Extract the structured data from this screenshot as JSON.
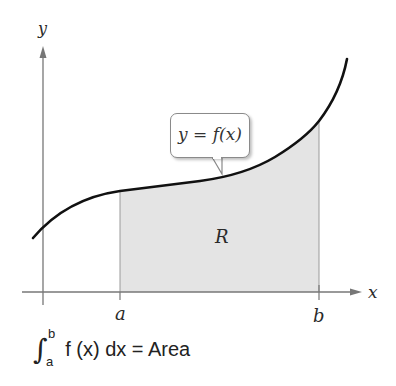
{
  "figure": {
    "axis_x_label": "x",
    "axis_y_label": "y",
    "a_label": "a",
    "b_label": "b",
    "region_label": "R",
    "callout_text": "y = f(x)",
    "equation": {
      "integral_symbol": "∫",
      "upper": "b",
      "lower": "a",
      "body": "f (x) dx = Area"
    },
    "colors": {
      "curve": "#111111",
      "axis": "#777777",
      "shade": "#e4e4e4",
      "shade_edge": "#9a9a9a"
    }
  }
}
